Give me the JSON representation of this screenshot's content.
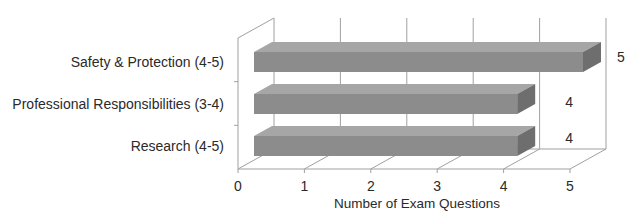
{
  "chart_data": {
    "type": "bar",
    "orientation": "horizontal",
    "style": "3d",
    "title": "",
    "xlabel": "Number of Exam Questions",
    "ylabel": "",
    "categories": [
      "Safety & Protection (4-5)",
      "Professional Responsibilities (3-4)",
      "Research (4-5)"
    ],
    "values": [
      5,
      4,
      4
    ],
    "value_labels": [
      "5",
      "4",
      "4"
    ],
    "xlim": [
      0,
      5
    ],
    "x_ticks": [
      "0",
      "1",
      "2",
      "3",
      "4",
      "5"
    ],
    "grid": true,
    "legend": null,
    "colors": {
      "bar_front": "#8c8c8c",
      "bar_top": "#a6a6a6",
      "bar_side": "#6e6e6e",
      "gridline": "#a0a0a0"
    }
  }
}
